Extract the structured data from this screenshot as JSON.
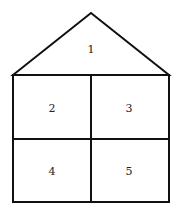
{
  "diagram": {
    "type": "house-shaped region diagram",
    "stroke_color": "#111111",
    "background": "#ffffff",
    "regions": [
      {
        "id": "roof",
        "label": "1"
      },
      {
        "id": "top-left",
        "label": "2"
      },
      {
        "id": "top-right",
        "label": "3"
      },
      {
        "id": "bottom-left",
        "label": "4"
      },
      {
        "id": "bottom-right",
        "label": "5"
      }
    ]
  }
}
